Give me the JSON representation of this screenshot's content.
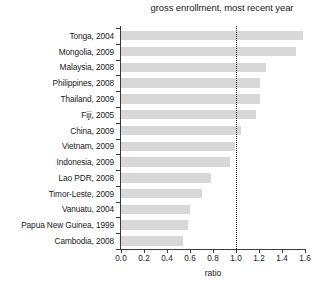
{
  "chart_data": {
    "type": "bar",
    "orientation": "horizontal",
    "title": "gross enrollment, most recent year",
    "xlabel": "ratio",
    "ylabel": "",
    "xlim": [
      0.0,
      1.6
    ],
    "grid": false,
    "legend": false,
    "xticks": [
      "0.0",
      "0.2",
      "0.4",
      "0.6",
      "0.8",
      "1.0",
      "1.2",
      "1.4",
      "1.6"
    ],
    "xtick_values": [
      0.0,
      0.2,
      0.4,
      0.6,
      0.8,
      1.0,
      1.2,
      1.4,
      1.6
    ],
    "categories": [
      "Tonga, 2004",
      "Mongolia, 2009",
      "Malaysia, 2008",
      "Philippines, 2008",
      "Thailand, 2009",
      "Fiji, 2005",
      "China, 2009",
      "Vietnam, 2009",
      "Indonesia, 2009",
      "Lao PDR, 2008",
      "Timor-Leste, 2009",
      "Vanuatu, 2004",
      "Papua New Guinea, 1999",
      "Cambodia, 2008"
    ],
    "values": [
      1.58,
      1.52,
      1.26,
      1.21,
      1.21,
      1.17,
      1.04,
      0.99,
      0.95,
      0.78,
      0.7,
      0.6,
      0.58,
      0.54
    ],
    "bar_color": "#d8d8d8",
    "annotations": [
      {
        "type": "reference-line",
        "orientation": "vertical",
        "value": 1.0,
        "style": "dotted",
        "color": "#242424"
      }
    ]
  }
}
